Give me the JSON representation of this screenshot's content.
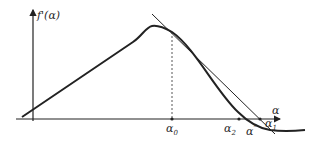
{
  "diagram": {
    "title": "",
    "y_axis": {
      "label": "f'(α)"
    },
    "x_axis": {
      "label": "α"
    },
    "points": {
      "alpha0": {
        "label": "α",
        "sub": "0"
      },
      "alpha1": {
        "label": "α",
        "sub": "1"
      },
      "alpha2": {
        "label": "α",
        "sub": "2"
      },
      "alpha_star": {
        "label": "α",
        "sup": "*"
      }
    },
    "elements": [
      "curve f'(α)",
      "tangent line at α0",
      "dashed vertical at α0"
    ],
    "colors": {
      "stroke": "#222222",
      "background": "#ffffff"
    }
  }
}
